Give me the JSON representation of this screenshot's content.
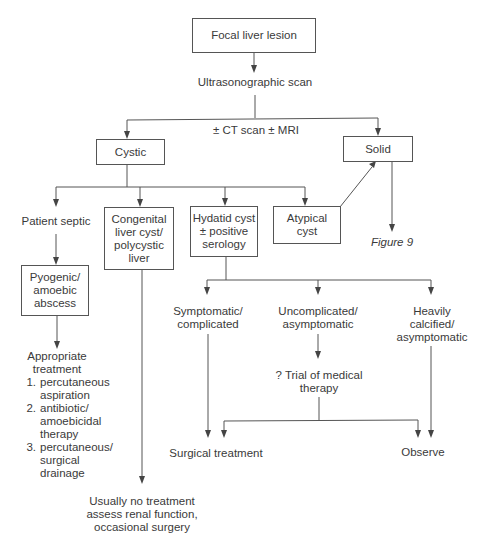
{
  "diagram": {
    "type": "flowchart",
    "nodes": {
      "focal_liver_lesion": "Focal liver lesion",
      "ultrasonographic_scan": "Ultrasonographic scan",
      "ct_mri": "± CT scan ± MRI",
      "cystic": "Cystic",
      "solid": "Solid",
      "figure9": "Figure 9",
      "patient_septic": "Patient septic",
      "congenital": "Congenital\nliver cyst/\npolycystic\nliver",
      "hydatid": "Hydatid cyst\n± positive\nserology",
      "atypical": "Atypical\ncyst",
      "pyogenic": "Pyogenic/\namoebic\nabscess",
      "appropriate_treatment": {
        "heading": "Appropriate\ntreatment",
        "items": [
          {
            "num": "1.",
            "text": "percutaneous\naspiration"
          },
          {
            "num": "2.",
            "text": "antibiotic/\namoebicidal\ntherapy"
          },
          {
            "num": "3.",
            "text": "percutaneous/\nsurgical\ndrainage"
          }
        ]
      },
      "usually_no_treatment": "Usually no treatment\nassess renal function,\noccasional surgery",
      "symptomatic": "Symptomatic/\ncomplicated",
      "uncomplicated": "Uncomplicated/\nasymptomatic",
      "heavily_calcified": "Heavily\ncalcified/\nasymptomatic",
      "trial_medical": "? Trial of medical\ntherapy",
      "surgical_treatment": "Surgical treatment",
      "observe": "Observe"
    },
    "edges": [
      [
        "Focal liver lesion",
        "Ultrasonographic scan"
      ],
      [
        "Ultrasonographic scan",
        "Cystic"
      ],
      [
        "Ultrasonographic scan",
        "Solid"
      ],
      [
        "Cystic",
        "Patient septic"
      ],
      [
        "Cystic",
        "Congenital liver cyst/polycystic liver"
      ],
      [
        "Cystic",
        "Hydatid cyst ± positive serology"
      ],
      [
        "Cystic",
        "Atypical cyst"
      ],
      [
        "Atypical cyst",
        "Solid"
      ],
      [
        "Solid",
        "Figure 9"
      ],
      [
        "Patient septic",
        "Pyogenic/amoebic abscess"
      ],
      [
        "Pyogenic/amoebic abscess",
        "Appropriate treatment"
      ],
      [
        "Congenital liver cyst/polycystic liver",
        "Usually no treatment"
      ],
      [
        "Hydatid cyst ± positive serology",
        "Symptomatic/complicated"
      ],
      [
        "Hydatid cyst ± positive serology",
        "Uncomplicated/asymptomatic"
      ],
      [
        "Hydatid cyst ± positive serology",
        "Heavily calcified/asymptomatic"
      ],
      [
        "Uncomplicated/asymptomatic",
        "? Trial of medical therapy"
      ],
      [
        "Symptomatic/complicated",
        "Surgical treatment"
      ],
      [
        "? Trial of medical therapy",
        "Surgical treatment"
      ],
      [
        "? Trial of medical therapy",
        "Observe"
      ],
      [
        "Heavily calcified/asymptomatic",
        "Observe"
      ]
    ]
  },
  "colors": {
    "line": "#555555",
    "text": "#3a3a3a",
    "background": "#ffffff"
  }
}
